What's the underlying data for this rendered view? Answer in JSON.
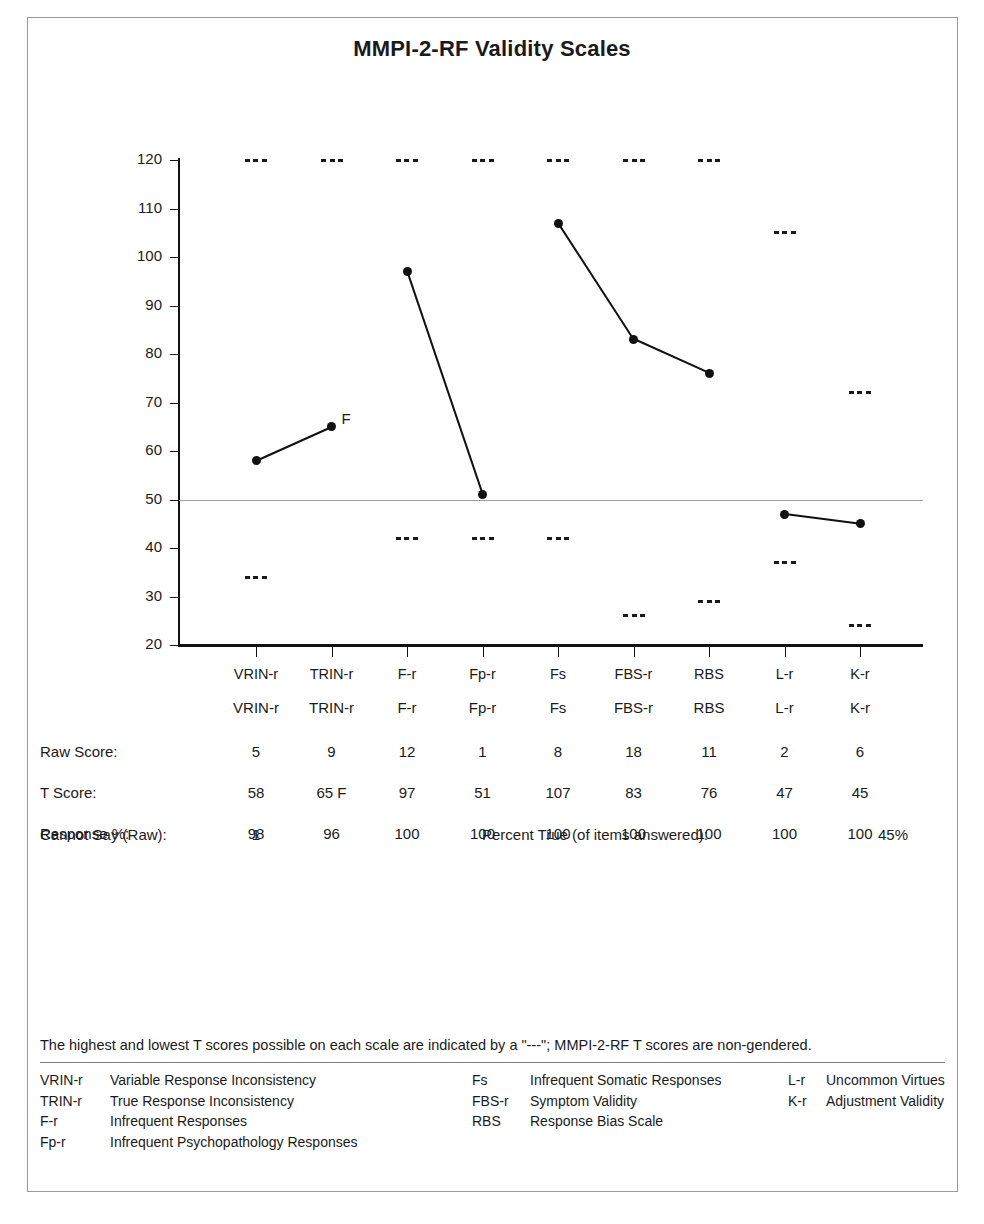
{
  "title": "MMPI-2-RF Validity Scales",
  "chart_data": {
    "type": "line",
    "title": "MMPI-2-RF Validity Scales",
    "xlabel": "",
    "ylabel": "",
    "ylim": [
      20,
      120
    ],
    "yticks": [
      20,
      30,
      40,
      50,
      60,
      70,
      80,
      90,
      100,
      110,
      120
    ],
    "grid": false,
    "reference_line": 50,
    "legend_position": "none",
    "categories": [
      "VRIN-r",
      "TRIN-r",
      "F-r",
      "Fp-r",
      "Fs",
      "FBS-r",
      "RBS",
      "L-r",
      "K-r"
    ],
    "series": [
      {
        "name": "T Score",
        "values": [
          58,
          65,
          97,
          51,
          107,
          83,
          76,
          47,
          45
        ],
        "segments": [
          [
            0,
            1
          ],
          [
            2,
            3
          ],
          [
            4,
            5,
            6
          ],
          [
            7,
            8
          ]
        ]
      }
    ],
    "annotations": [
      {
        "category": "TRIN-r",
        "text": "F",
        "value": 65
      }
    ],
    "max_possible_t": [
      120,
      120,
      120,
      120,
      120,
      120,
      120,
      105,
      72
    ],
    "min_possible_t": [
      34,
      null,
      42,
      42,
      42,
      26,
      29,
      37,
      24
    ]
  },
  "table": {
    "column_headers": [
      "VRIN-r",
      "TRIN-r",
      "F-r",
      "Fp-r",
      "Fs",
      "FBS-r",
      "RBS",
      "L-r",
      "K-r"
    ],
    "rows": [
      {
        "label": "Raw Score:",
        "values": [
          "5",
          "9",
          "12",
          "1",
          "8",
          "18",
          "11",
          "2",
          "6"
        ]
      },
      {
        "label": "T Score:",
        "values": [
          "58",
          "65 F",
          "97",
          "51",
          "107",
          "83",
          "76",
          "47",
          "45"
        ]
      },
      {
        "label": "Response %:",
        "values": [
          "98",
          "96",
          "100",
          "100",
          "100",
          "100",
          "100",
          "100",
          "100"
        ]
      }
    ],
    "cannot_say_label": "Cannot Say (Raw):",
    "cannot_say_value": "1",
    "percent_true_label": "Percent True (of items answered):",
    "percent_true_value": "45%"
  },
  "footnote": "The highest and lowest T scores possible on each scale are indicated by a \"---\"; MMPI-2-RF T scores are non-gendered.",
  "legend": {
    "col1": [
      {
        "abbr": "VRIN-r",
        "name": "Variable Response Inconsistency"
      },
      {
        "abbr": "TRIN-r",
        "name": "True Response Inconsistency"
      },
      {
        "abbr": "F-r",
        "name": "Infrequent Responses"
      },
      {
        "abbr": "Fp-r",
        "name": "Infrequent Psychopathology Responses"
      }
    ],
    "col2": [
      {
        "abbr": "Fs",
        "name": "Infrequent Somatic Responses"
      },
      {
        "abbr": "FBS-r",
        "name": "Symptom Validity"
      },
      {
        "abbr": "RBS",
        "name": "Response Bias Scale"
      }
    ],
    "col3": [
      {
        "abbr": "L-r",
        "name": "Uncommon Virtues"
      },
      {
        "abbr": "K-r",
        "name": "Adjustment Validity"
      }
    ]
  },
  "colors": {
    "line": "#111111",
    "reference_line": "#9d9d9d",
    "frame": "#9a9a9a"
  }
}
